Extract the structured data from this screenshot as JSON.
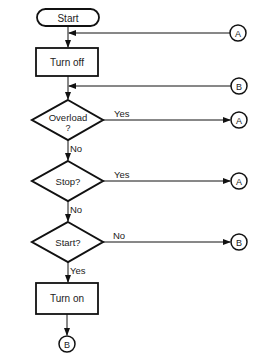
{
  "flowchart": {
    "nodes": {
      "start": {
        "label": "Start",
        "type": "terminator"
      },
      "turn_off": {
        "label": "Turn off",
        "type": "process"
      },
      "overload": {
        "label_line1": "Overload",
        "label_line2": "?",
        "type": "decision"
      },
      "stop": {
        "label": "Stop?",
        "type": "decision"
      },
      "start_q": {
        "label": "Start?",
        "type": "decision"
      },
      "turn_on": {
        "label": "Turn on",
        "type": "process"
      }
    },
    "connectors": {
      "a_top": "A",
      "b_top": "B",
      "a_overload": "A",
      "a_stop": "A",
      "b_start": "B",
      "b_bottom": "B"
    },
    "edge_labels": {
      "overload_yes": "Yes",
      "overload_no": "No",
      "stop_yes": "Yes",
      "stop_no": "No",
      "start_no": "No",
      "start_yes": "Yes"
    }
  }
}
